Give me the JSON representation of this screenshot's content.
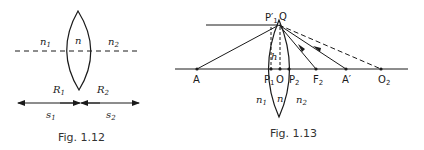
{
  "fig12": {
    "caption": "Fig. 1.12",
    "labels": {
      "n1": "n",
      "n1_sub": "1",
      "n": "n",
      "n2": "n",
      "n2_sub": "2",
      "R1": "R",
      "R1_sub": "1",
      "R2": "R",
      "R2_sub": "2",
      "s1": "s",
      "s1_sub": "1",
      "s2": "s",
      "s2_sub": "2"
    }
  },
  "fig13": {
    "caption": "Fig. 1.13",
    "labels": {
      "Pprime": "P′",
      "P1_sub": "1",
      "Q": "Q",
      "h": "h",
      "A": "A",
      "P1": "P",
      "O": "O",
      "P2": "P",
      "P2_sub": "2",
      "F2": "F",
      "F2_sub": "2",
      "Aprime": "A′",
      "O2": "O",
      "O2_sub": "2",
      "n1": "n",
      "n1_sub": "1",
      "n": "n",
      "n2": "n",
      "n2_sub": "2"
    }
  },
  "colors": {
    "ink": "#1a1a1a",
    "caption": "#333333"
  }
}
